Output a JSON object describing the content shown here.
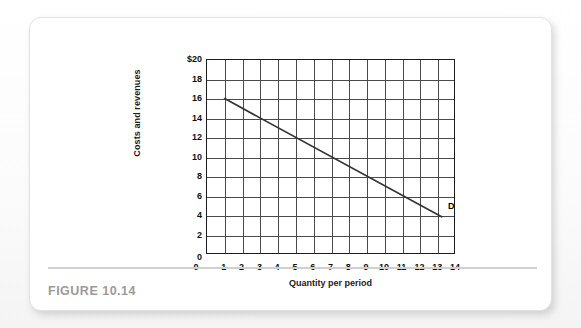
{
  "figure": {
    "caption": "FIGURE 10.14"
  },
  "chart_data": {
    "type": "line",
    "title": "",
    "xlabel": "Quantity per period",
    "ylabel": "Costs and revenues",
    "xlim": [
      0,
      14
    ],
    "ylim": [
      0,
      20
    ],
    "grid": true,
    "legend_position": "inline-annotation",
    "x_ticks": [
      0,
      1,
      2,
      3,
      4,
      5,
      6,
      7,
      8,
      9,
      10,
      11,
      12,
      13,
      14
    ],
    "x_tick_labels": [
      "0",
      "1",
      "2",
      "3",
      "4",
      "5",
      "6",
      "7",
      "8",
      "9",
      "10",
      "11",
      "12",
      "13",
      "14"
    ],
    "y_ticks": [
      0,
      2,
      4,
      6,
      8,
      10,
      12,
      14,
      16,
      18,
      20
    ],
    "y_tick_labels": [
      "0",
      "2",
      "4",
      "6",
      "8",
      "10",
      "12",
      "14",
      "16",
      "18",
      "$20"
    ],
    "series": [
      {
        "name": "D",
        "label": "D",
        "color": "#333333",
        "points": [
          {
            "x": 1,
            "y": 16
          },
          {
            "x": 13.3,
            "y": 3.75
          }
        ],
        "annotation": "D",
        "annotation_x": 13.55,
        "annotation_y": 4.9
      }
    ]
  }
}
